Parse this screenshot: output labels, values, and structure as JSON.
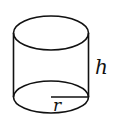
{
  "figure": {
    "shape": "cylinder",
    "labels": {
      "height": "h",
      "radius": "r"
    },
    "colors": {
      "stroke": "#111111",
      "background": "#ffffff"
    }
  }
}
